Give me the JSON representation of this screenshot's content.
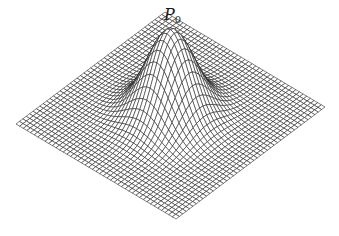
{
  "figure": {
    "type": "3d-wireframe-surface",
    "label": {
      "main": "P",
      "subscript": "0",
      "x": 164,
      "y": 7
    },
    "projection": {
      "left_corner": [
        16,
        124
      ],
      "right_corner": [
        325,
        107
      ],
      "front_corner": [
        176,
        219
      ],
      "peak_height_px": 86
    },
    "mesh": {
      "grid_lines": 44,
      "sigma": 0.115,
      "stroke_color": "#1a1a1a",
      "fill_color": "#ffffff",
      "stroke_width": 0.55
    }
  }
}
